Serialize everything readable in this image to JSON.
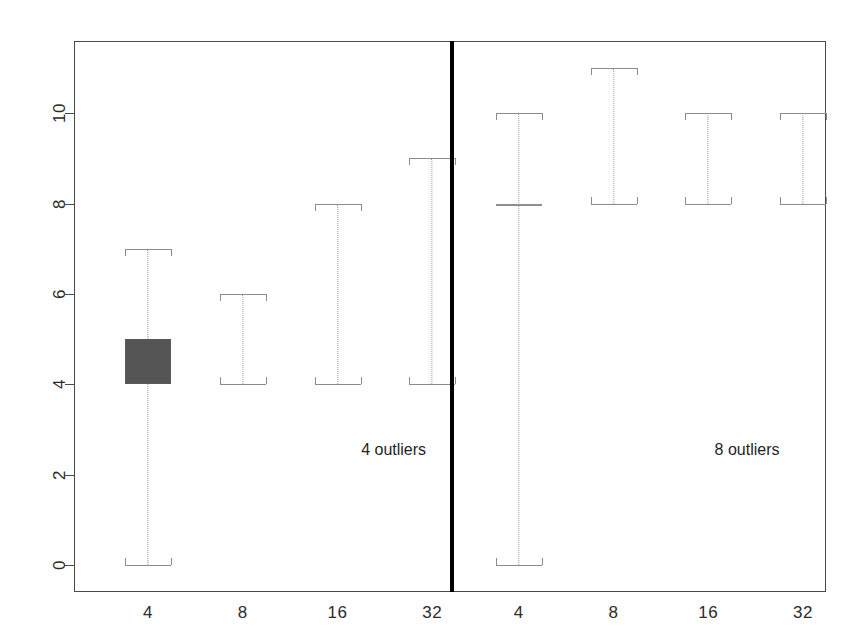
{
  "chart_data": {
    "type": "boxplot",
    "title": "",
    "xlabel": "",
    "ylabel": "",
    "ylim": [
      -0.6,
      11.6
    ],
    "yticks": [
      0,
      2,
      4,
      6,
      8,
      10
    ],
    "ytick_labels": [
      "0",
      "2",
      "4",
      "6",
      "8",
      "10"
    ],
    "grid": false,
    "legend": "none",
    "panels": [
      {
        "name": "left-panel",
        "annotation": "4 outliers",
        "categories": [
          "4",
          "8",
          "16",
          "32"
        ],
        "boxes": [
          {
            "category": "4",
            "whisker_low": 0,
            "q1": 4,
            "median": 4,
            "q3": 5,
            "whisker_high": 7,
            "filled": true
          },
          {
            "category": "8",
            "whisker_low": 4,
            "q1": 4,
            "median": 4,
            "q3": 4,
            "whisker_high": 6,
            "filled": false
          },
          {
            "category": "16",
            "whisker_low": 4,
            "q1": 4,
            "median": 4,
            "q3": 4,
            "whisker_high": 8,
            "filled": false
          },
          {
            "category": "32",
            "whisker_low": 4,
            "q1": 4,
            "median": 4,
            "q3": 4,
            "whisker_high": 9,
            "filled": false
          }
        ]
      },
      {
        "name": "right-panel",
        "annotation": "8 outliers",
        "categories": [
          "4",
          "8",
          "16",
          "32"
        ],
        "boxes": [
          {
            "category": "4",
            "whisker_low": 0,
            "q1": 8,
            "median": 8,
            "q3": 8,
            "whisker_high": 10,
            "filled": false,
            "degenerate_line": true
          },
          {
            "category": "8",
            "whisker_low": 8,
            "q1": 8,
            "median": 8,
            "q3": 8,
            "whisker_high": 11,
            "filled": false
          },
          {
            "category": "16",
            "whisker_low": 8,
            "q1": 8,
            "median": 8,
            "q3": 8,
            "whisker_high": 10,
            "filled": false
          },
          {
            "category": "32",
            "whisker_low": 8,
            "q1": 8,
            "median": 8,
            "q3": 8,
            "whisker_high": 10,
            "filled": false
          }
        ]
      }
    ],
    "colors": {
      "box_fill": "#555555",
      "box_line": "#8c8c8c",
      "whisker": "#9a9a9a",
      "frame": "#4a4a4a",
      "divider": "#000000",
      "text": "#2b2b2b",
      "background": "#ffffff"
    }
  },
  "geometry": {
    "divider_x_frac": 0.5,
    "box_half_width_px": 23,
    "cap_half_width_px": 23,
    "panel_slot_centers_frac": [
      0.0985,
      0.2245,
      0.3505,
      0.4765,
      0.5915,
      0.7175,
      0.8435,
      0.9695
    ],
    "annotation_positions": [
      {
        "x_frac": 0.425,
        "y_value": 2.55
      },
      {
        "x_frac": 0.895,
        "y_value": 2.55
      }
    ]
  }
}
